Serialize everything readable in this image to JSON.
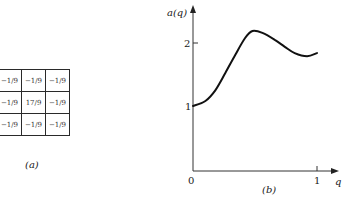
{
  "panel_a": {
    "caption": "(a)",
    "grid": [
      [
        "−1/9",
        "−1/9",
        "−1/9"
      ],
      [
        "−1/9",
        "17/9",
        "−1/9"
      ],
      [
        "−1/9",
        "−1/9",
        "−1/9"
      ]
    ]
  },
  "panel_b": {
    "caption": "(b)",
    "ylabel": "a(q)",
    "xlabel": "q",
    "origin_label": "0",
    "x_ticks": [
      "1"
    ],
    "y_ticks": [
      "1",
      "2"
    ]
  },
  "chart_data": {
    "type": "line",
    "title": "",
    "xlabel": "q",
    "ylabel": "a(q)",
    "x": [
      0.0,
      0.1,
      0.18,
      0.26,
      0.34,
      0.42,
      0.48,
      0.56,
      0.66,
      0.74,
      0.82,
      0.92,
      1.0
    ],
    "series": [
      {
        "name": "a(q)",
        "values": [
          1.0,
          1.08,
          1.25,
          1.52,
          1.81,
          2.08,
          2.19,
          2.16,
          2.05,
          1.94,
          1.84,
          1.79,
          1.84
        ]
      }
    ],
    "xlim": [
      0,
      1.15
    ],
    "ylim": [
      0,
      2.5
    ],
    "x_ticks": [
      1
    ],
    "y_ticks": [
      1,
      2
    ],
    "grid": false,
    "legend": "none"
  }
}
